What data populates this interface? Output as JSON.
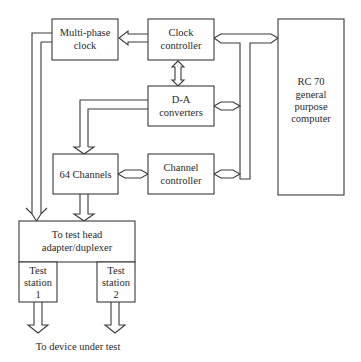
{
  "diagram": {
    "type": "block-diagram",
    "blocks": {
      "multiphase_clock": {
        "lines": [
          "Multi-phase",
          "clock"
        ]
      },
      "clock_controller": {
        "lines": [
          "Clock",
          "controller"
        ]
      },
      "da_converters": {
        "lines": [
          "D-A",
          "converters"
        ]
      },
      "computer": {
        "lines": [
          "RC 70",
          "general",
          "purpose",
          "computer"
        ]
      },
      "channels": {
        "lines": [
          "64 Channels"
        ]
      },
      "channel_controller": {
        "lines": [
          "Channel",
          "controller"
        ]
      },
      "adapter": {
        "lines": [
          "To test head",
          "adapter/duplexer"
        ]
      },
      "station1": {
        "lines": [
          "Test",
          "station",
          "1"
        ]
      },
      "station2": {
        "lines": [
          "Test",
          "station",
          "2"
        ]
      }
    },
    "caption": "To device under test",
    "connections": [
      {
        "from": "clock_controller",
        "to": "multiphase_clock",
        "kind": "bus-arrow"
      },
      {
        "from": "clock_controller",
        "to": "da_converters",
        "kind": "bidirectional-bus"
      },
      {
        "from": "clock_controller",
        "to": "computer",
        "kind": "bidirectional-bus"
      },
      {
        "from": "da_converters",
        "to": "system_bus",
        "kind": "bidirectional-bus"
      },
      {
        "from": "channel_controller",
        "to": "system_bus",
        "kind": "bidirectional-bus"
      },
      {
        "from": "channels",
        "to": "channel_controller",
        "kind": "bidirectional-bus"
      },
      {
        "from": "da_converters",
        "to": "channels",
        "kind": "bus-arrow"
      },
      {
        "from": "multiphase_clock",
        "to": "adapter",
        "kind": "bus-arrow"
      },
      {
        "from": "channels",
        "to": "adapter",
        "kind": "bus-arrow"
      },
      {
        "from": "station1",
        "to": "device_under_test",
        "kind": "bus-arrow"
      },
      {
        "from": "station2",
        "to": "device_under_test",
        "kind": "bus-arrow"
      }
    ]
  }
}
